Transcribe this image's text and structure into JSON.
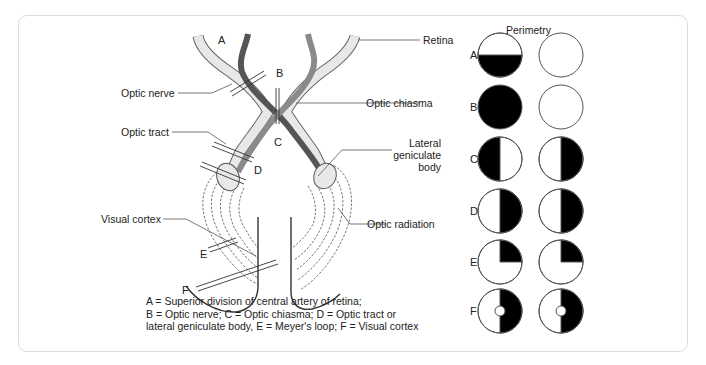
{
  "diagram": {
    "labels": {
      "optic_nerve": "Optic nerve",
      "optic_tract": "Optic tract",
      "visual_cortex": "Visual cortex",
      "retina": "Retina",
      "optic_chiasma": "Optic chiasma",
      "lateral_geniculate_body": [
        "Lateral",
        "geniculate",
        "body"
      ],
      "optic_radiation": "Optic radiation"
    },
    "lesion_letters": [
      "A",
      "B",
      "C",
      "D",
      "E",
      "F"
    ],
    "caption": [
      "A = Superior division of central artery of retina;",
      "B = Optic nerve; C = Optic chiasma; D = Optic tract or",
      "lateral geniculate body, E = Meyer's loop; F = Visual cortex"
    ],
    "colors": {
      "nerve_light": "#e6e6e6",
      "nerve_dark": "#555555",
      "nerve_mid": "#8a8a8a",
      "outline": "#555555",
      "defect": "#000000"
    }
  },
  "perimetry": {
    "title": "Perimetry",
    "rows": [
      {
        "letter": "A",
        "left_eye": "inferior half defect",
        "right_eye": "normal"
      },
      {
        "letter": "B",
        "left_eye": "complete blindness",
        "right_eye": "normal"
      },
      {
        "letter": "C",
        "left_eye": "temporal (left) half defect",
        "right_eye": "temporal (right) half defect"
      },
      {
        "letter": "D",
        "left_eye": "right half defect",
        "right_eye": "right half defect"
      },
      {
        "letter": "E",
        "left_eye": "right upper quadrant defect",
        "right_eye": "right upper quadrant defect"
      },
      {
        "letter": "F",
        "left_eye": "right half defect with macular sparing",
        "right_eye": "right half defect with macular sparing"
      }
    ]
  }
}
